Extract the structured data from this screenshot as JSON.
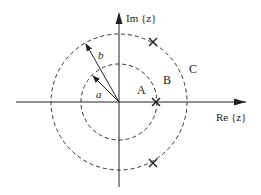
{
  "diagram": {
    "type": "z-plane pole-zero / region of convergence",
    "axes": {
      "real_label": "Re {z}",
      "imag_label": "Im {z}"
    },
    "circles": [
      {
        "name": "inner",
        "radius_label": "a",
        "style": "dashed"
      },
      {
        "name": "outer",
        "radius_label": "b",
        "style": "dashed"
      }
    ],
    "regions": [
      {
        "label": "A",
        "description": "inside inner circle"
      },
      {
        "label": "B",
        "description": "between circles"
      },
      {
        "label": "C",
        "description": "outside outer circle"
      }
    ],
    "poles": [
      {
        "marker": "×",
        "location": "on real axis, inner circle"
      },
      {
        "marker": "×",
        "location": "upper, outer circle"
      },
      {
        "marker": "×",
        "location": "lower, outer circle"
      }
    ],
    "vectors": [
      {
        "label": "a"
      },
      {
        "label": "b"
      }
    ]
  },
  "colors": {
    "stroke": "#222222",
    "background": "#ffffff"
  }
}
